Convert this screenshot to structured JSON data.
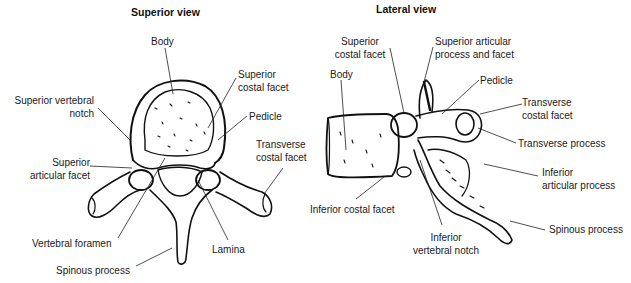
{
  "figure": {
    "type": "anatomical-diagram"
  },
  "superior_view": {
    "title": "Superior view",
    "labels": {
      "body": "Body",
      "superior_costal_facet": "Superior\ncostal facet",
      "superior_vertebral_notch": "Superior vertebral\nnotch",
      "pedicle": "Pedicle",
      "transverse_costal_facet": "Transverse\ncostal facet",
      "superior_articular_facet": "Superior\narticular facet",
      "vertebral_foramen": "Vertebral foramen",
      "lamina": "Lamina",
      "spinous_process": "Spinous process"
    }
  },
  "lateral_view": {
    "title": "Lateral view",
    "labels": {
      "superior_costal_facet": "Superior\ncostal facet",
      "superior_articular_process_and_facet": "Superior articular\nprocess and facet",
      "body": "Body",
      "pedicle": "Pedicle",
      "transverse_costal_facet": "Transverse\ncostal facet",
      "transverse_process": "Transverse process",
      "inferior_articular_process": "Inferior\narticular process",
      "inferior_costal_facet": "Inferior costal facet",
      "inferior_vertebral_notch": "Inferior\nvertebral notch",
      "spinous_process": "Spinous process"
    }
  },
  "colors": {
    "ink": "#111111",
    "background": "#ffffff"
  }
}
